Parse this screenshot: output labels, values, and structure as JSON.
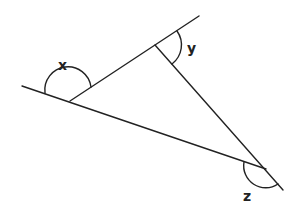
{
  "diagram": {
    "type": "triangle-exterior-angles",
    "stroke_color": "#222222",
    "background": "#ffffff",
    "labels": {
      "x": "x",
      "y": "y",
      "z": "z"
    }
  }
}
